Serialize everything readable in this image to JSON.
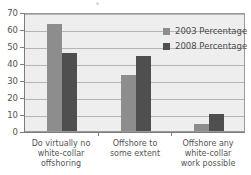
{
  "chart_data": {
    "type": "bar",
    "title": "",
    "subtitle": "",
    "xlabel": "",
    "ylabel": "",
    "categories": [
      "Do virtually no\nwhite-collar\noffshoring",
      "Offshore to\nsome extent",
      "Offshore any\nwhite-collar\nwork possible"
    ],
    "series": [
      {
        "name": "2003 Percentage",
        "color": "#8d8d8d",
        "values": [
          63,
          33,
          4
        ]
      },
      {
        "name": "2008 Percentage",
        "color": "#4f4f4f",
        "values": [
          46,
          44,
          10
        ]
      }
    ],
    "ylim": [
      0,
      70
    ],
    "yticks": [
      0,
      10,
      20,
      30,
      40,
      50,
      60,
      70
    ],
    "ytick_labels": [
      "0",
      "10",
      "20",
      "30",
      "40",
      "50",
      "60",
      "70"
    ],
    "grid": "horizontal",
    "legend_position": "top-right",
    "plot_background": "#eeeeee",
    "gridline_color": "#b4b4b4",
    "axis_color": "#7d7d7d"
  },
  "legend": {
    "items": [
      {
        "label": "2003 Percentage",
        "color": "#8d8d8d"
      },
      {
        "label": "2008 Percentage",
        "color": "#4f4f4f"
      }
    ]
  }
}
